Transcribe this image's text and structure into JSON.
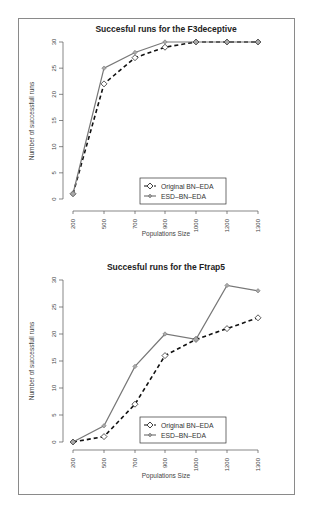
{
  "chart_data": [
    {
      "type": "line",
      "title": "Succesful runs for the F3deceptive",
      "xlabel": "Populations Size",
      "ylabel": "Number of successfull runs",
      "categories": [
        "200",
        "500",
        "700",
        "900",
        "1000",
        "1200",
        "1300"
      ],
      "ylim": [
        0,
        30
      ],
      "yticks": [
        "0",
        "5",
        "10",
        "15",
        "20",
        "25",
        "30"
      ],
      "grid": false,
      "legend_position": "bottom-right-inside",
      "series": [
        {
          "name": "Original BN–EDA",
          "values": [
            1,
            22,
            27,
            29,
            30,
            30,
            30
          ],
          "style": "dashed",
          "marker": "open-diamond",
          "color": "#111111"
        },
        {
          "name": "ESD–BN–EDA",
          "values": [
            1,
            25,
            28,
            30,
            30,
            30,
            30
          ],
          "style": "solid",
          "marker": "diamond",
          "color": "#777777"
        }
      ]
    },
    {
      "type": "line",
      "title": "Succesful runs for the Ftrap5",
      "xlabel": "Populations Size",
      "ylabel": "Number of successfull runs",
      "categories": [
        "200",
        "500",
        "700",
        "900",
        "1000",
        "1200",
        "1300"
      ],
      "ylim": [
        0,
        30
      ],
      "yticks": [
        "0",
        "5",
        "10",
        "15",
        "20",
        "25",
        "30"
      ],
      "grid": false,
      "legend_position": "bottom-right-inside",
      "series": [
        {
          "name": "Original BN–EDA",
          "values": [
            0,
            1,
            7,
            16,
            19,
            21,
            23
          ],
          "style": "dashed",
          "marker": "open-diamond",
          "color": "#111111"
        },
        {
          "name": "ESD–BN–EDA",
          "values": [
            0,
            3,
            14,
            20,
            19,
            29,
            28
          ],
          "style": "solid",
          "marker": "diamond",
          "color": "#777777"
        }
      ]
    }
  ],
  "charts": [
    {
      "title": "Succesful runs for the F3deceptive",
      "xlabel": "Populations Size",
      "ylabel": "Number of successfull runs",
      "legend": {
        "series0": "Original BN–EDA",
        "series1": "ESD–BN–EDA"
      }
    },
    {
      "title": "Succesful runs for the Ftrap5",
      "xlabel": "Populations Size",
      "ylabel": "Number of successfull runs",
      "legend": {
        "series0": "Original BN–EDA",
        "series1": "ESD–BN–EDA"
      }
    }
  ]
}
